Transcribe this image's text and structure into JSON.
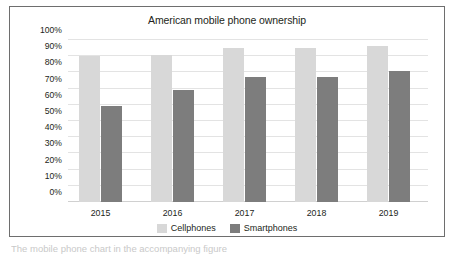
{
  "chart_data": {
    "type": "bar",
    "title": "American mobile phone ownership",
    "xlabel": "",
    "ylabel": "",
    "categories": [
      "2015",
      "2016",
      "2017",
      "2018",
      "2019"
    ],
    "series": [
      {
        "name": "Cellphones",
        "color": "#d8d8d8",
        "values": [
          90,
          91,
          95,
          95,
          96
        ]
      },
      {
        "name": "Smartphones",
        "color": "#7d7d7d",
        "values": [
          59,
          69,
          77,
          77,
          81
        ]
      }
    ],
    "ylim": [
      0,
      100
    ],
    "ytick_labels": [
      "100%",
      "90%",
      "80%",
      "70%",
      "60%",
      "50%",
      "40%",
      "30%",
      "20%",
      "10%",
      "0%"
    ],
    "ytick_values": [
      100,
      90,
      80,
      70,
      60,
      50,
      40,
      30,
      20,
      10,
      0
    ],
    "grid": true,
    "legend_position": "bottom"
  },
  "caption": "The mobile phone chart in the accompanying figure"
}
